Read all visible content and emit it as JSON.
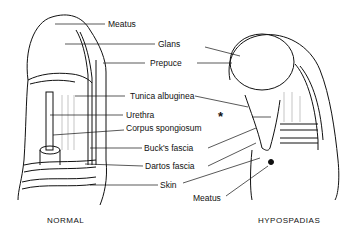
{
  "figure": {
    "labels": [
      {
        "id": "meatus-top",
        "text": "Meatus"
      },
      {
        "id": "glans",
        "text": "Glans"
      },
      {
        "id": "prepuce",
        "text": "Prepuce"
      },
      {
        "id": "tunica",
        "text": "Tunica albuginea"
      },
      {
        "id": "urethra",
        "text": "Urethra"
      },
      {
        "id": "corpus",
        "text": "Corpus spongiosum"
      },
      {
        "id": "bucks",
        "text": "Buck's fascia"
      },
      {
        "id": "dartos",
        "text": "Dartos fascia"
      },
      {
        "id": "skin",
        "text": "Skin"
      },
      {
        "id": "meatus-bottom",
        "text": "Meatus"
      }
    ],
    "asterisk": "*",
    "captions": {
      "left": "NORMAL",
      "right": "HYPOSPADIAS"
    }
  }
}
